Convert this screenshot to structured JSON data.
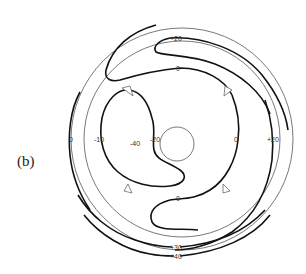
{
  "figure": {
    "panel_label": "(b)",
    "contour_labels": {
      "top_outer": "+20",
      "top_inner": "0",
      "left_outer": "0",
      "left_inner": "-10",
      "center_left": "-40",
      "center": "-20",
      "right_inner": "0",
      "right_outer": "+20",
      "bottom_inner": "0",
      "bottom_30": "+30",
      "bottom_40": "+40"
    },
    "colors": {
      "line": "#111111",
      "thin_line": "#555555",
      "background": "#ffffff"
    }
  }
}
